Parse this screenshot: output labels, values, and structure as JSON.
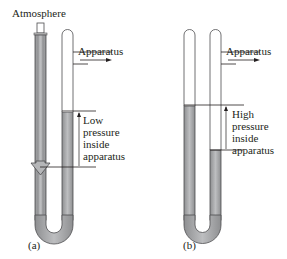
{
  "diagram": {
    "colors": {
      "fluid": "#a8a9ab",
      "fluid_dark": "#8e8f91",
      "tube_outline": "#4d4d4f",
      "line": "#231f20",
      "arrow_fill": "#b5b6b8"
    },
    "panel_a": {
      "caption": "(a)",
      "top_label": "Atmosphere",
      "side_label": "Apparatus",
      "pressure_label": [
        "Low",
        "pressure",
        "inside",
        "apparatus"
      ]
    },
    "panel_b": {
      "caption": "(b)",
      "side_label": "Apparatus",
      "pressure_label": [
        "High",
        "pressure",
        "inside",
        "apparatus"
      ]
    }
  }
}
